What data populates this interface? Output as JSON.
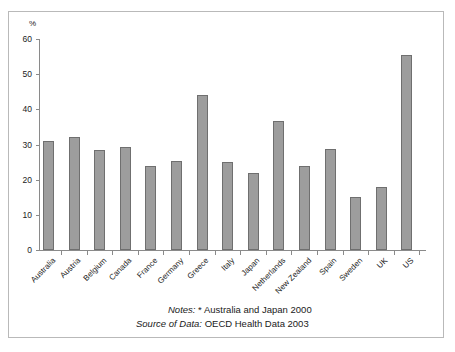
{
  "chart_data": {
    "type": "bar",
    "title": "",
    "xlabel": "",
    "ylabel": "%",
    "ylim": [
      0,
      60
    ],
    "yticks": [
      0,
      10,
      20,
      30,
      40,
      50,
      60
    ],
    "grid": false,
    "legend": null,
    "categories": [
      "Australia",
      "Austria",
      "Belgium",
      "Canada",
      "France",
      "Germany",
      "Greece",
      "Italy",
      "Japan",
      "Netherlands",
      "New Zealand",
      "Spain",
      "Sweden",
      "UK",
      "US"
    ],
    "values": [
      31,
      32,
      28.5,
      29.3,
      24,
      25.2,
      44,
      25,
      22,
      36.7,
      24,
      28.7,
      15,
      18,
      55.5
    ],
    "bar_color": "#9d9d9d",
    "bar_border_color": "#6f6f6f",
    "axis_color": "#8a8a8a"
  },
  "axis": {
    "unit_label": "%",
    "tick_labels": [
      "60",
      "50",
      "40",
      "30",
      "20",
      "10",
      "0"
    ]
  },
  "notes": {
    "notes_label": "Notes:",
    "notes_text": "* Australia and Japan 2000",
    "source_label": "Source of Data:",
    "source_text": "OECD Health Data 2003"
  }
}
